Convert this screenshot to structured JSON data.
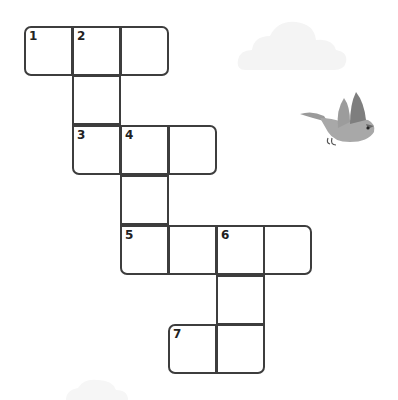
{
  "puzzle": {
    "type": "crossword",
    "cell_size": 48,
    "line_color": "#3d3d3d",
    "cells": [
      {
        "row": 0,
        "col": 0,
        "number": "1",
        "x": 24,
        "y": 26,
        "corners": "tl bl"
      },
      {
        "row": 0,
        "col": 1,
        "number": "2",
        "x": 72,
        "y": 26,
        "corners": ""
      },
      {
        "row": 0,
        "col": 2,
        "number": "",
        "x": 120,
        "y": 26,
        "corners": "tr br"
      },
      {
        "row": 1,
        "col": 1,
        "number": "",
        "x": 72,
        "y": 75,
        "corners": ""
      },
      {
        "row": 2,
        "col": 1,
        "number": "3",
        "x": 72,
        "y": 125,
        "corners": "bl"
      },
      {
        "row": 2,
        "col": 2,
        "number": "4",
        "x": 120,
        "y": 125,
        "corners": ""
      },
      {
        "row": 2,
        "col": 3,
        "number": "",
        "x": 168,
        "y": 125,
        "corners": "tr br"
      },
      {
        "row": 3,
        "col": 2,
        "number": "",
        "x": 120,
        "y": 175,
        "corners": ""
      },
      {
        "row": 4,
        "col": 2,
        "number": "5",
        "x": 120,
        "y": 225,
        "corners": "bl"
      },
      {
        "row": 4,
        "col": 3,
        "number": "",
        "x": 168,
        "y": 225,
        "corners": ""
      },
      {
        "row": 4,
        "col": 4,
        "number": "6",
        "x": 216,
        "y": 225,
        "corners": ""
      },
      {
        "row": 4,
        "col": 5,
        "number": "",
        "x": 263,
        "y": 225,
        "corners": "tr br"
      },
      {
        "row": 5,
        "col": 4,
        "number": "",
        "x": 216,
        "y": 275,
        "corners": ""
      },
      {
        "row": 6,
        "col": 3,
        "number": "7",
        "x": 168,
        "y": 324,
        "corners": "tl bl"
      },
      {
        "row": 6,
        "col": 4,
        "number": "",
        "x": 216,
        "y": 324,
        "corners": "br"
      }
    ]
  },
  "decorations": {
    "cloud_top": "cloud-icon",
    "cloud_bottom": "cloud-icon",
    "bird": "bird-icon",
    "bird_color": "#8a8a8a"
  }
}
